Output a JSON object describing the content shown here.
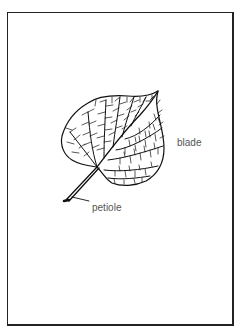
{
  "figure": {
    "labels": {
      "blade": "blade",
      "petiole": "petiole"
    },
    "colors": {
      "line": "#111111",
      "label_text": "#555555",
      "frame": "#222222",
      "background": "#ffffff"
    }
  }
}
